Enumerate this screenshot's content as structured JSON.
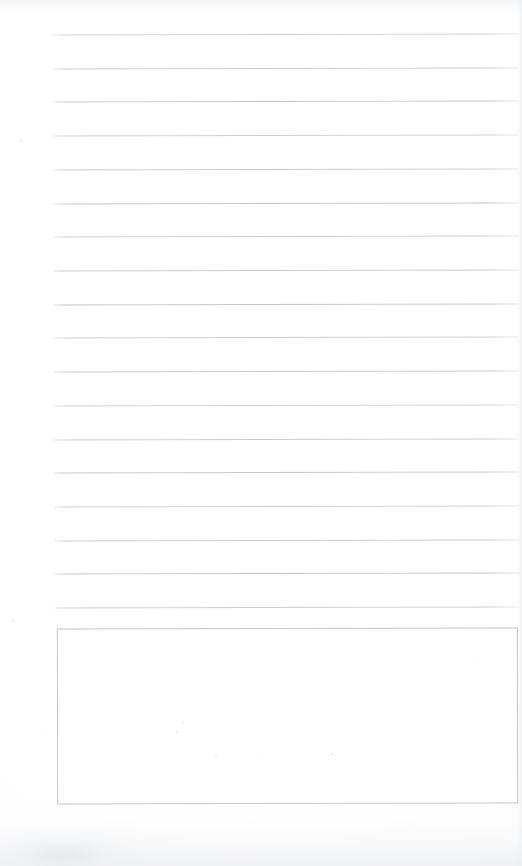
{
  "document": {
    "kind": "scanned-blank-lined-notepad-page",
    "title": "",
    "page_width": 522,
    "page_height": 866,
    "background_color": "#fefefe",
    "has_text_content": false,
    "text_content": "",
    "ruled_lines": {
      "count": 18,
      "color": "#c1c2c7",
      "thickness_px": 1,
      "left_x": 54,
      "right_x": 519,
      "first_line_y": 34,
      "spacing_px": 33.7,
      "last_line_y": 607,
      "skew_degrees": -0.13,
      "y_positions": [
        34,
        68,
        101,
        135,
        169,
        203,
        236,
        270,
        304,
        337,
        371,
        405,
        439,
        472,
        506,
        540,
        573,
        607
      ]
    },
    "answer_box": {
      "label": "",
      "left_x": 57,
      "top_y": 628,
      "right_x": 518,
      "bottom_y": 804,
      "width": 461,
      "height": 176,
      "border_color": "#c5c6ca",
      "border_width_px": 1,
      "fill_color": "#ffffff",
      "content": ""
    },
    "margins": {
      "left_margin_px": 54,
      "right_margin_px": 3,
      "top_margin_px": 34,
      "bottom_margin_px": 62,
      "vertical_margin_rule": false
    },
    "scan_artifacts": {
      "top_shade_height_px": 14,
      "bottom_shade_height_px": 66,
      "bottom_left_smudge": true,
      "right_edge_shadow": true,
      "dust_flecks": [
        {
          "x": 12,
          "y": 620,
          "size": 2
        },
        {
          "x": 176,
          "y": 731,
          "size": 2
        },
        {
          "x": 215,
          "y": 754,
          "size": 2
        },
        {
          "x": 263,
          "y": 755,
          "size": 1
        },
        {
          "x": 330,
          "y": 757,
          "size": 1
        },
        {
          "x": 331,
          "y": 753,
          "size": 2
        },
        {
          "x": 182,
          "y": 721,
          "size": 2
        },
        {
          "x": 46,
          "y": 735,
          "size": 1
        },
        {
          "x": 479,
          "y": 661,
          "size": 1
        },
        {
          "x": 106,
          "y": 350,
          "size": 1
        },
        {
          "x": 20,
          "y": 140,
          "size": 2
        },
        {
          "x": 9,
          "y": 420,
          "size": 1
        }
      ]
    }
  }
}
